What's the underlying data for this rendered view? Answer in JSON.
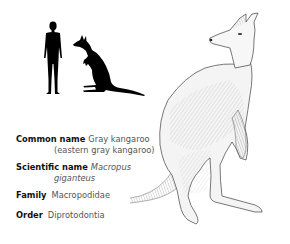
{
  "silhouettes": {
    "human_icon": "human-silhouette",
    "kangaroo_icon": "kangaroo-silhouette"
  },
  "illustration": {
    "subject": "gray kangaroo drawing"
  },
  "facts": {
    "common_name": {
      "label": "Common name",
      "value": "Gray kangaroo",
      "continuation": "(eastern gray kangaroo)"
    },
    "scientific_name": {
      "label": "Scientific name",
      "value": "Macropus",
      "continuation": "giganteus"
    },
    "family": {
      "label": "Family",
      "value": "Macropodidae"
    },
    "order": {
      "label": "Order",
      "value": "Diprotodontia"
    }
  }
}
